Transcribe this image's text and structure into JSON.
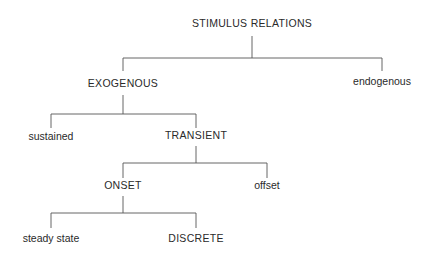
{
  "diagram": {
    "type": "tree",
    "nodes": {
      "root": {
        "label": "STIMULUS RELATIONS",
        "x": 252,
        "y": 24
      },
      "exogenous": {
        "label": "EXOGENOUS",
        "x": 123,
        "y": 84
      },
      "endogenous": {
        "label": "endogenous",
        "x": 382,
        "y": 82
      },
      "sustained": {
        "label": "sustained",
        "x": 51,
        "y": 137
      },
      "transient": {
        "label": "TRANSIENT",
        "x": 196,
        "y": 136
      },
      "onset": {
        "label": "ONSET",
        "x": 123,
        "y": 186
      },
      "offset": {
        "label": "offset",
        "x": 267,
        "y": 186
      },
      "steady_state": {
        "label": "steady state",
        "x": 51,
        "y": 239
      },
      "discrete": {
        "label": "DISCRETE",
        "x": 196,
        "y": 239
      }
    },
    "edges": [
      {
        "parent": "STIMULUS RELATIONS",
        "children": [
          "EXOGENOUS",
          "endogenous"
        ]
      },
      {
        "parent": "EXOGENOUS",
        "children": [
          "sustained",
          "TRANSIENT"
        ]
      },
      {
        "parent": "TRANSIENT",
        "children": [
          "ONSET",
          "offset"
        ]
      },
      {
        "parent": "ONSET",
        "children": [
          "steady state",
          "DISCRETE"
        ]
      }
    ],
    "colors": {
      "line": "#555555",
      "text": "#2a2a2a",
      "background": "#ffffff"
    }
  }
}
